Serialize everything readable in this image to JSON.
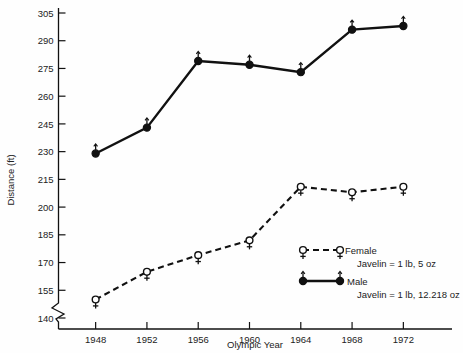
{
  "chart_data": {
    "type": "line",
    "title": "",
    "xlabel": "Olympic Year",
    "ylabel": "Distance (ft)",
    "categories": [
      "1948",
      "1952",
      "1956",
      "1960",
      "1964",
      "1968",
      "1972"
    ],
    "x": [
      1948,
      1952,
      1956,
      1960,
      1964,
      1968,
      1972
    ],
    "xlim": [
      1946,
      1974
    ],
    "ylim": [
      140,
      305
    ],
    "yticks": [
      140,
      155,
      170,
      185,
      200,
      215,
      230,
      245,
      260,
      275,
      290,
      305
    ],
    "ytick_labels": [
      "140",
      "155",
      "170",
      "185",
      "200",
      "215",
      "230",
      "245",
      "260",
      "275",
      "290",
      "305"
    ],
    "xticks": [
      1948,
      1952,
      1956,
      1960,
      1964,
      1968,
      1972
    ],
    "xtick_labels": [
      "1948",
      "1952",
      "1956",
      "1960",
      "1964",
      "1968",
      "1972"
    ],
    "grid": false,
    "axis_break": true,
    "axis_break_note": "zigzag break on y-axis below 140",
    "legend_position": "inside-lower-right",
    "series": [
      {
        "name": "Female",
        "sub_label": "Javelin = 1 lb, 5 oz",
        "marker": "open-circle-female-symbol",
        "line_style": "dashed",
        "color": "#111111",
        "values": [
          150,
          165,
          174,
          182,
          211,
          208,
          211
        ]
      },
      {
        "name": "Male",
        "sub_label": "Javelin = 1 lb, 12.218 oz",
        "marker": "filled-circle-male-symbol",
        "line_style": "solid",
        "color": "#111111",
        "values": [
          229,
          243,
          279,
          277,
          273,
          296,
          298
        ]
      }
    ]
  },
  "legend": {
    "female_label": "Female",
    "female_sub": "Javelin = 1 lb, 5 oz",
    "male_label": "Male",
    "male_sub": "Javelin = 1 lb, 12.218 oz"
  },
  "axes": {
    "y_title": "Distance (ft)",
    "x_title": "Olympic Year"
  },
  "colors": {
    "ink": "#111111",
    "background": "#fefefe"
  }
}
